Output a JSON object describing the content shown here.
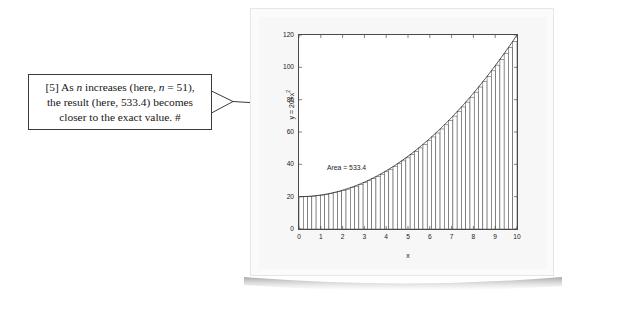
{
  "annotation": {
    "lines": [
      "[5] As n increases (here, n = 51),",
      "the result (here, 533.4) becomes",
      "closer to the exact value.  #"
    ],
    "line1_a": "[5] As ",
    "line1_n1": "n",
    "line1_b": " increases (here, ",
    "line1_n2": "n",
    "line1_c": " = 51),",
    "line2": "the result (here, 533.4) becomes",
    "line3": "closer to the exact value.  #",
    "pointer_icon": "callout-pointer-icon"
  },
  "figure": {
    "area_label": "Area = 533.4",
    "area_value": 533.4,
    "n_rectangles": 51
  },
  "chart_data": {
    "type": "area",
    "title": "",
    "xlabel": "x",
    "ylabel": "y = 20+x^2",
    "ylabel_base": "y = 20+x",
    "ylabel_exp": "2",
    "xlim": [
      0,
      10
    ],
    "ylim": [
      0,
      120
    ],
    "xticks": [
      0,
      1,
      2,
      3,
      4,
      5,
      6,
      7,
      8,
      9,
      10
    ],
    "yticks": [
      0,
      20,
      40,
      60,
      80,
      100,
      120
    ],
    "xtick_labels": [
      "0",
      "1",
      "2",
      "3",
      "4",
      "5",
      "6",
      "7",
      "8",
      "9",
      "10"
    ],
    "ytick_labels": [
      "0",
      "20",
      "40",
      "60",
      "80",
      "100",
      "120"
    ],
    "grid": false,
    "legend": null,
    "function": "y = 20 + x^2",
    "annotations": [
      {
        "text": "Area = 533.4",
        "x": 1.3,
        "y": 44
      }
    ],
    "n_rectangles": 51,
    "curve_color": "#333333",
    "rect_edge_color": "#4d4d4d",
    "rect_face_color": "#ffffff",
    "series": [
      {
        "name": "y = 20+x^2",
        "x": [
          0,
          0.5,
          1,
          1.5,
          2,
          2.5,
          3,
          3.5,
          4,
          4.5,
          5,
          5.5,
          6,
          6.5,
          7,
          7.5,
          8,
          8.5,
          9,
          9.5,
          10
        ],
        "values": [
          20,
          20.25,
          21,
          22.25,
          24,
          26.25,
          29,
          32.25,
          36,
          40.25,
          45,
          50.25,
          56,
          62.25,
          69,
          76.25,
          84,
          92.25,
          101,
          110.25,
          120
        ]
      }
    ]
  }
}
